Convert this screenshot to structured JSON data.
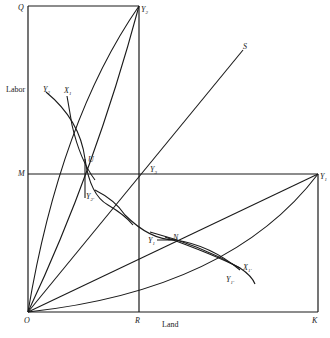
{
  "diagram": {
    "type": "Edgeworth box / production contract curve diagram",
    "axes": {
      "vertical_label": "Labor",
      "horizontal_label": "Land"
    },
    "points": {
      "origin": "O",
      "top_left": "Q",
      "top_mid": "Y",
      "top_mid_sub": "2",
      "middle_left": "M",
      "center": "Y",
      "center_sub": "3",
      "right_mid": "Y",
      "right_mid_sub": "1",
      "bottom_mid": "R",
      "bottom_right": "K",
      "ray_end": "S",
      "intersection_upper": "U",
      "intersection_lower": "N"
    },
    "curves": {
      "upper_y": "Y",
      "upper_y_sub": "2",
      "upper_x": "X",
      "upper_x_sub": "1",
      "upper_y_prime": "Y",
      "upper_y_prime_sub": "2′",
      "lower_y": "Y",
      "lower_y_sub": "1",
      "lower_x_prime": "X",
      "lower_x_prime_sub": "1′",
      "lower_y_prime": "Y",
      "lower_y_prime_sub": "1′"
    }
  }
}
